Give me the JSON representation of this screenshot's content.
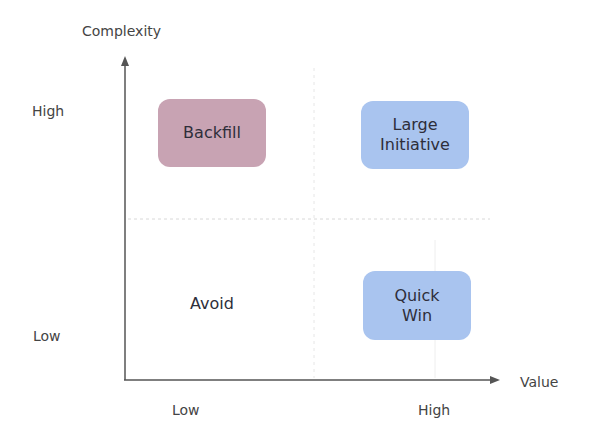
{
  "axes": {
    "y_title": "Complexity",
    "x_title": "Value",
    "y_ticks": {
      "high": "High",
      "low": "Low"
    },
    "x_ticks": {
      "low": "Low",
      "high": "High"
    }
  },
  "quadrants": {
    "top_left": {
      "label": "Backfill",
      "color": "#c8a3b3"
    },
    "top_right": {
      "label_line1": "Large",
      "label_line2": "Initiative",
      "color": "#a9c4ef"
    },
    "bottom_left": {
      "label": "Avoid",
      "color": "#ffffff"
    },
    "bottom_right": {
      "label_line1": "Quick",
      "label_line2": "Win",
      "color": "#a9c4ef"
    }
  },
  "colors": {
    "axis": "#555555",
    "grid": "#d8d8d8"
  }
}
